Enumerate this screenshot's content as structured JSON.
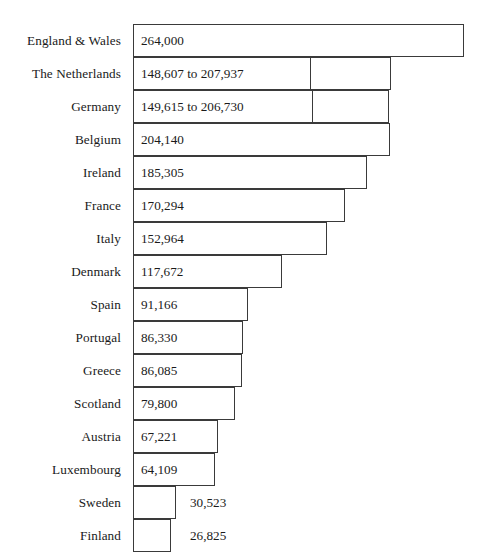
{
  "chart_data": {
    "type": "bar",
    "orientation": "horizontal",
    "title": "",
    "subtitle": "",
    "xlabel": "",
    "ylabel": "",
    "grid": false,
    "legend": null,
    "axis_visible": false,
    "baseline_x_px": 133,
    "xlim": [
      0,
      264000
    ],
    "categories": [
      "England & Wales",
      "The Netherlands",
      "Germany",
      "Belgium",
      "Ireland",
      "France",
      "Italy",
      "Denmark",
      "Spain",
      "Portugal",
      "Greece",
      "Scotland",
      "Austria",
      "Luxembourg",
      "Sweden",
      "Finland"
    ],
    "values": [
      264000,
      207937,
      206730,
      204140,
      185305,
      170294,
      152964,
      117672,
      91166,
      86330,
      86085,
      79800,
      67221,
      64109,
      30523,
      26825
    ],
    "value_labels": [
      "264,000",
      "148,607 to 207,937",
      "149,615 to 206,730",
      "204,140",
      "185,305",
      "170,294",
      "152,964",
      "117,672",
      "91,166",
      "86,330",
      "86,085",
      "79,800",
      "67,221",
      "64,109",
      "30,523",
      "26,825"
    ],
    "range_low": [
      null,
      148607,
      149615,
      null,
      null,
      null,
      null,
      null,
      null,
      null,
      null,
      null,
      null,
      null,
      null,
      null
    ],
    "range_high": [
      null,
      207937,
      206730,
      null,
      null,
      null,
      null,
      null,
      null,
      null,
      null,
      null,
      null,
      null,
      null,
      null
    ],
    "colors": {
      "bar_fill": "#ffffff",
      "bar_stroke": "#3a3a3a",
      "text": "#1a1a1a",
      "background": "#ffffff"
    }
  },
  "rows": [
    {
      "label": "England & Wales",
      "value_label": "264,000",
      "bar_px": 331,
      "divider_px": null,
      "label_inside": true,
      "value_left_px": null
    },
    {
      "label": "The Netherlands",
      "value_label": "148,607 to 207,937",
      "bar_px": 258,
      "divider_px": 176,
      "label_inside": true,
      "value_left_px": null
    },
    {
      "label": "Germany",
      "value_label": "149,615 to 206,730",
      "bar_px": 256,
      "divider_px": 178,
      "label_inside": true,
      "value_left_px": null
    },
    {
      "label": "Belgium",
      "value_label": "204,140",
      "bar_px": 257,
      "divider_px": null,
      "label_inside": true,
      "value_left_px": null
    },
    {
      "label": "Ireland",
      "value_label": "185,305",
      "bar_px": 234,
      "divider_px": null,
      "label_inside": true,
      "value_left_px": null
    },
    {
      "label": "France",
      "value_label": "170,294",
      "bar_px": 212,
      "divider_px": null,
      "label_inside": true,
      "value_left_px": null
    },
    {
      "label": "Italy",
      "value_label": "152,964",
      "bar_px": 194,
      "divider_px": null,
      "label_inside": true,
      "value_left_px": null
    },
    {
      "label": "Denmark",
      "value_label": "117,672",
      "bar_px": 149,
      "divider_px": null,
      "label_inside": true,
      "value_left_px": null
    },
    {
      "label": "Spain",
      "value_label": "91,166",
      "bar_px": 115,
      "divider_px": null,
      "label_inside": true,
      "value_left_px": null
    },
    {
      "label": "Portugal",
      "value_label": "86,330",
      "bar_px": 110,
      "divider_px": null,
      "label_inside": true,
      "value_left_px": null
    },
    {
      "label": "Greece",
      "value_label": "86,085",
      "bar_px": 109,
      "divider_px": null,
      "label_inside": true,
      "value_left_px": null
    },
    {
      "label": "Scotland",
      "value_label": "79,800",
      "bar_px": 102,
      "divider_px": null,
      "label_inside": true,
      "value_left_px": null
    },
    {
      "label": "Austria",
      "value_label": "67,221",
      "bar_px": 85,
      "divider_px": null,
      "label_inside": true,
      "value_left_px": null
    },
    {
      "label": "Luxembourg",
      "value_label": "64,109",
      "bar_px": 82,
      "divider_px": null,
      "label_inside": true,
      "value_left_px": null
    },
    {
      "label": "Sweden",
      "value_label": "30,523",
      "bar_px": 43,
      "divider_px": null,
      "label_inside": false,
      "value_left_px": 190
    },
    {
      "label": "Finland",
      "value_label": "26,825",
      "bar_px": 38,
      "divider_px": null,
      "label_inside": false,
      "value_left_px": 190
    }
  ],
  "layout": {
    "baseline_left_px": 133,
    "row_height_px": 33,
    "first_row_top_px": 24
  }
}
